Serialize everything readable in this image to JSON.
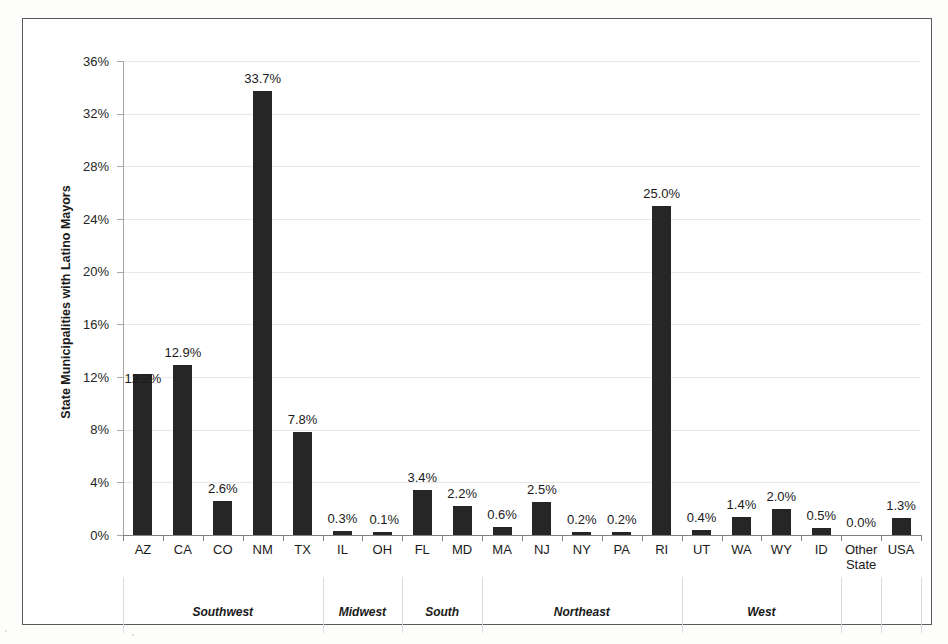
{
  "figure": {
    "background_color": "#fdfdfc",
    "frame_color": "#595959",
    "bar_color": "#262626",
    "gridline_color": "#e8e8e8"
  },
  "chart_data": {
    "type": "bar",
    "title": "",
    "xlabel": "",
    "ylabel": "State Municipalities with Latino Mayors",
    "ylim": [
      0,
      36
    ],
    "ytick_step": 4,
    "ytick_labels": [
      "0%",
      "4%",
      "8%",
      "12%",
      "16%",
      "20%",
      "24%",
      "28%",
      "32%",
      "36%"
    ],
    "ytick_values": [
      0,
      4,
      8,
      12,
      16,
      20,
      24,
      28,
      32,
      36
    ],
    "grid": true,
    "legend": "none",
    "categories": [
      "AZ",
      "CA",
      "CO",
      "NM",
      "TX",
      "IL",
      "OH",
      "FL",
      "MD",
      "MA",
      "NJ",
      "NY",
      "PA",
      "RI",
      "UT",
      "WA",
      "WY",
      "ID",
      "Other State",
      "USA"
    ],
    "values": [
      12.2,
      12.9,
      2.6,
      33.7,
      7.8,
      0.3,
      0.1,
      3.4,
      2.2,
      0.6,
      2.5,
      0.2,
      0.2,
      25.0,
      0.4,
      1.4,
      2.0,
      0.5,
      0.0,
      1.3
    ],
    "data_labels": [
      "12.2%",
      "12.9%",
      "2.6%",
      "33.7%",
      "7.8%",
      "0.3%",
      "0.1%",
      "3.4%",
      "2.2%",
      "0.6%",
      "2.5%",
      "0.2%",
      "0.2%",
      "25.0%",
      "0.4%",
      "1.4%",
      "2.0%",
      "0.5%",
      "0.0%",
      "1.3%"
    ],
    "group_labels": [
      "Southwest",
      "Midwest",
      "South",
      "Northeast",
      "West"
    ],
    "groups": [
      {
        "label": "Southwest",
        "members": [
          "AZ",
          "CA",
          "CO",
          "NM",
          "TX"
        ],
        "start_index": 0,
        "end_index": 4
      },
      {
        "label": "Midwest",
        "members": [
          "IL",
          "OH"
        ],
        "start_index": 5,
        "end_index": 6
      },
      {
        "label": "South",
        "members": [
          "FL",
          "MD"
        ],
        "start_index": 7,
        "end_index": 8
      },
      {
        "label": "Northeast",
        "members": [
          "MA",
          "NJ",
          "NY",
          "PA",
          "RI"
        ],
        "start_index": 9,
        "end_index": 13
      },
      {
        "label": "West",
        "members": [
          "UT",
          "WA",
          "WY",
          "ID"
        ],
        "start_index": 14,
        "end_index": 17
      }
    ],
    "ungrouped": [
      "Other State",
      "USA"
    ]
  }
}
